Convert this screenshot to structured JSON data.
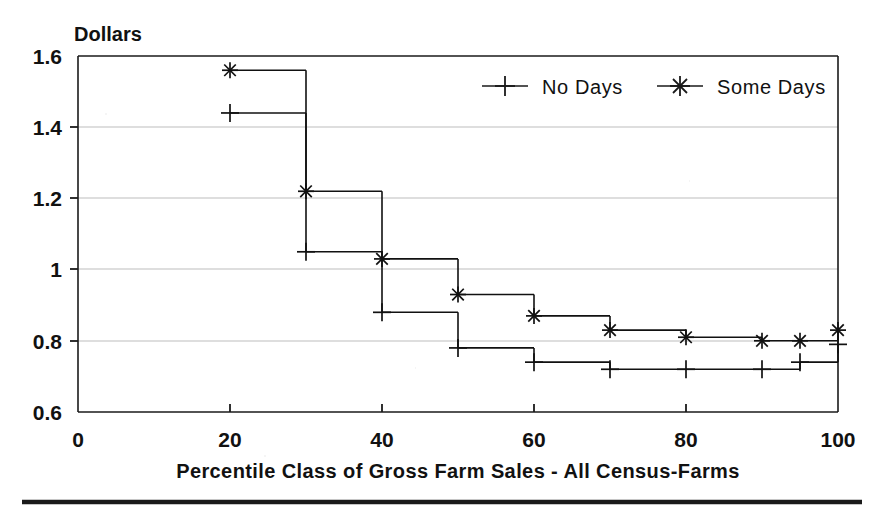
{
  "chart_data": {
    "type": "line",
    "title": "",
    "subtitle": "",
    "xlabel": "Percentile Class of Gross Farm Sales - All Census-Farms",
    "ylabel": "Dollars",
    "ylabel_position": "top-left",
    "xlim": [
      0,
      100
    ],
    "ylim": [
      0.6,
      1.6
    ],
    "xticks": [
      0,
      20,
      40,
      60,
      80,
      100
    ],
    "xticklabels": [
      "0",
      "20",
      "40",
      "60",
      "80",
      "100"
    ],
    "yticks": [
      0.6,
      0.8,
      1.0,
      1.2,
      1.4,
      1.6
    ],
    "yticklabels": [
      "0.6",
      "0.8",
      "1",
      "1.2",
      "1.4",
      "1.6"
    ],
    "grid": "horizontal",
    "drawstyle": "steps-post",
    "legend_position": "top-right-inside",
    "series": [
      {
        "name": "No Days",
        "marker": "plus",
        "x": [
          20,
          30,
          40,
          50,
          60,
          70,
          80,
          90,
          95,
          100
        ],
        "values": [
          1.44,
          1.05,
          0.88,
          0.78,
          0.74,
          0.72,
          0.72,
          0.72,
          0.74,
          0.79
        ]
      },
      {
        "name": "Some Days",
        "marker": "asterisk",
        "x": [
          20,
          30,
          40,
          50,
          60,
          70,
          80,
          90,
          95,
          100
        ],
        "values": [
          1.56,
          1.22,
          1.03,
          0.93,
          0.87,
          0.83,
          0.81,
          0.8,
          0.8,
          0.83
        ]
      }
    ]
  },
  "legend": {
    "entries": [
      {
        "label": "No Days",
        "marker": "plus"
      },
      {
        "label": "Some Days",
        "marker": "asterisk"
      }
    ]
  },
  "axes": {
    "y_unit_label": "Dollars",
    "x_axis_title": "Percentile Class of Gross Farm Sales - All Census-Farms",
    "y_tick_labels": [
      "1.6",
      "1.4",
      "1.2",
      "1",
      "0.8",
      "0.6"
    ],
    "x_tick_labels": [
      "0",
      "20",
      "40",
      "60",
      "80",
      "100"
    ]
  },
  "colors": {
    "ink": "#111111",
    "grid": "#b9b9b9",
    "frame": "#1a1a1a",
    "background": "#ffffff"
  }
}
